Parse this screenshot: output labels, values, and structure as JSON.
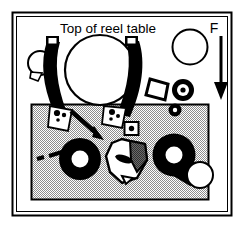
{
  "figure": {
    "title": "Top of reel table",
    "force_label": "F",
    "background_color": "#ffffff",
    "ink_color": "#000000",
    "panel_fill_color": "#c9c9c9",
    "shade_color": "#5f5f5f",
    "border": {
      "outer": {
        "x": 12,
        "y": 12,
        "width": 220,
        "height": 204
      },
      "inner_offset": 4
    }
  },
  "labels": {
    "title_text": "Top of reel table",
    "title_x": 108,
    "title_y": 32,
    "force_text": "F",
    "force_x": 214,
    "force_y": 32
  },
  "elements": {
    "reel_circle": {
      "name": "large-reel",
      "cx": 100,
      "cy": 70,
      "r": 35
    },
    "upper_right_circle": {
      "name": "secondary-reel",
      "cx": 190,
      "cy": 47,
      "r": 17
    },
    "small_left_circle": {
      "name": "small-idler",
      "cx": 40,
      "cy": 63,
      "r": 12
    },
    "force_arrow": {
      "name": "force-arrow",
      "x": 221,
      "y1": 34,
      "y2": 99,
      "direction": "down"
    },
    "diagonal_arrow": {
      "name": "insertion-arrow",
      "x1": 72,
      "y1": 112,
      "x2": 100,
      "y2": 136
    },
    "dashed_pointer": {
      "name": "dashed-leader-line",
      "x1": 38,
      "y1": 158,
      "x2": 62,
      "y2": 153
    },
    "gray_panel": {
      "name": "shaded-panel",
      "x": 31,
      "y": 104,
      "width": 178,
      "height": 96
    },
    "left_arm": {
      "name": "left-guide-arm"
    },
    "right_arm": {
      "name": "right-guide-arm"
    },
    "left_bracket": {
      "name": "left-arm-bracket"
    },
    "right_bracket": {
      "name": "right-arm-bracket"
    },
    "tilted_square": {
      "name": "tilted-square-plate",
      "cx": 159,
      "cy": 89
    },
    "washer_pulley": {
      "name": "washer-pulley",
      "cx": 183,
      "cy": 90,
      "r_outer": 11,
      "r_mid": 5,
      "r_inner": 2
    },
    "small_ring": {
      "name": "small-ring",
      "cx": 175,
      "cy": 110,
      "r_outer": 6,
      "r_inner": 2
    },
    "detail_square": {
      "name": "detail-square-marker",
      "cx": 132,
      "cy": 129
    },
    "left_hub": {
      "name": "left-capstan-hub",
      "cx": 80,
      "cy": 159,
      "r_outer": 21,
      "r_inner": 8
    },
    "center_shape": {
      "name": "irregular-guide-shape",
      "cx": 122,
      "cy": 163
    },
    "right_hub": {
      "name": "right-capstan-hub",
      "cx": 174,
      "cy": 155,
      "r_outer": 21,
      "r_inner": 8
    },
    "right_roller": {
      "name": "pinch-roller",
      "cx": 200,
      "cy": 175,
      "r": 13
    }
  }
}
